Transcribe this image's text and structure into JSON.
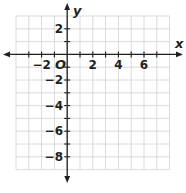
{
  "diagram": {
    "type": "coordinate-plane",
    "x_axis_label": "x",
    "y_axis_label": "y",
    "origin_label": "O",
    "x_range": [
      -4,
      8
    ],
    "y_range": [
      -9,
      3
    ],
    "grid_spacing": 1,
    "x_tick_labels": [
      "−2",
      "2",
      "4",
      "6"
    ],
    "y_tick_labels": [
      "2",
      "−2",
      "−4",
      "−6",
      "−8"
    ],
    "colors": {
      "grid": "#d0d0d0",
      "axis": "#231f20",
      "text": "#231f20"
    }
  }
}
